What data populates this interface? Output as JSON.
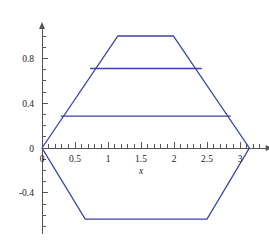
{
  "chart_data": {
    "type": "line",
    "title": "",
    "xlabel": "x",
    "ylabel": "",
    "xlim": [
      -0.08,
      3.42
    ],
    "ylim": [
      -0.77,
      1.08
    ],
    "grid": false,
    "legend": null,
    "x_ticks": [
      {
        "value": 0,
        "label": "0"
      },
      {
        "value": 0.5,
        "label": "0.5"
      },
      {
        "value": 1,
        "label": "1"
      },
      {
        "value": 1.5,
        "label": "1.5"
      },
      {
        "value": 2,
        "label": "2"
      },
      {
        "value": 2.5,
        "label": "2.5"
      },
      {
        "value": 3,
        "label": "3"
      }
    ],
    "y_ticks": [
      {
        "value": 0.8,
        "label": "0.8"
      },
      {
        "value": 0.4,
        "label": "0.4"
      },
      {
        "value": 0,
        "label": "0"
      },
      {
        "value": -0.4,
        "label": "-0.4"
      }
    ],
    "x_minor_tick_step": 0.1,
    "y_minor_tick_step": 0.1,
    "series": [
      {
        "name": "hexagon-outline",
        "type": "closed-polygon",
        "color": "#3b42a8",
        "points": [
          [
            0,
            0
          ],
          [
            1.15,
            1.0
          ],
          [
            1.99,
            1.0
          ],
          [
            3.1416,
            0
          ],
          [
            2.5,
            -0.635
          ],
          [
            0.655,
            -0.635
          ]
        ]
      },
      {
        "name": "upper-chord",
        "type": "segment",
        "color": "#3b42a8",
        "points": [
          [
            0.73,
            0.71
          ],
          [
            2.42,
            0.71
          ]
        ]
      },
      {
        "name": "lower-chord",
        "type": "segment",
        "color": "#3b42a8",
        "points": [
          [
            0.285,
            0.285
          ],
          [
            2.86,
            0.285
          ]
        ]
      }
    ],
    "colors": {
      "curve": "#3b42a8",
      "axis": "#555555",
      "text": "#1a1a1a",
      "background": "#ffffff"
    }
  }
}
